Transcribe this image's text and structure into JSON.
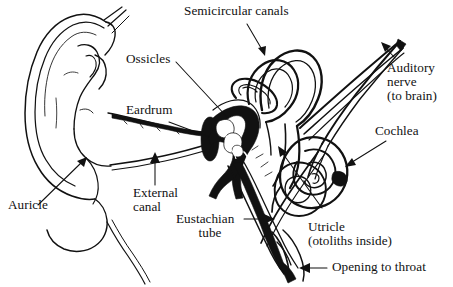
{
  "figure": {
    "style": "black-and-white line drawing",
    "background_color": "#ffffff",
    "ink_color": "#111111",
    "width": 453,
    "height": 287
  },
  "labels": {
    "semicircular_canals": "Semicircular canals",
    "ossicles": "Ossicles",
    "eardrum": "Eardrum",
    "auditory_nerve_line1": "Auditory",
    "auditory_nerve_line2": "nerve",
    "auditory_nerve_line3": "(to brain)",
    "cochlea": "Cochlea",
    "auricle": "Auricle",
    "external_canal_line1": "External",
    "external_canal_line2": "canal",
    "eustachian_line1": "Eustachian",
    "eustachian_line2": "tube",
    "utricle_line1": "Utricle",
    "utricle_line2": "(otoliths inside)",
    "opening_to_throat": "Opening to throat"
  },
  "parts": [
    {
      "id": "auricle",
      "name": "Auricle",
      "region": "outer ear"
    },
    {
      "id": "external-canal",
      "name": "External canal",
      "region": "outer ear"
    },
    {
      "id": "eardrum",
      "name": "Eardrum",
      "region": "middle ear"
    },
    {
      "id": "ossicles",
      "name": "Ossicles",
      "region": "middle ear"
    },
    {
      "id": "eustachian-tube",
      "name": "Eustachian tube",
      "region": "middle ear"
    },
    {
      "id": "opening-to-throat",
      "name": "Opening to throat",
      "region": "middle ear"
    },
    {
      "id": "semicircular-canals",
      "name": "Semicircular canals",
      "region": "inner ear"
    },
    {
      "id": "utricle",
      "name": "Utricle (otoliths inside)",
      "region": "inner ear"
    },
    {
      "id": "cochlea",
      "name": "Cochlea",
      "region": "inner ear"
    },
    {
      "id": "auditory-nerve",
      "name": "Auditory nerve (to brain)",
      "region": "inner ear"
    }
  ]
}
